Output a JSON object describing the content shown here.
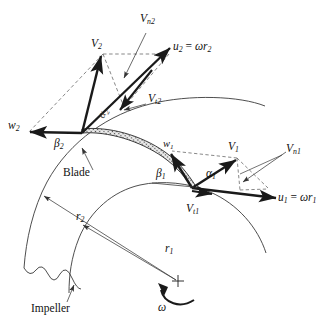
{
  "figure": {
    "title_caption": "",
    "type": "diagram",
    "colors": {
      "line": "#1a1a1a",
      "thin_line": "#3a3a3a",
      "background": "#ffffff",
      "blade_fill": "#d8d8d8"
    }
  },
  "labels": {
    "V2": {
      "base": "V",
      "sub": "2"
    },
    "Vn2": {
      "base": "V",
      "sub": "n2"
    },
    "Vt2": {
      "base": "V",
      "sub": "t2"
    },
    "u2": {
      "text": "u",
      "sub": "2",
      "eq": " = ",
      "omega": "ω",
      "r": "r",
      "rsub": "2"
    },
    "w2": {
      "base": "w",
      "sub": "2"
    },
    "beta2": {
      "base": "β",
      "sub": "2"
    },
    "alpha2": {
      "base": "α",
      "sub": "2"
    },
    "V1": {
      "base": "V",
      "sub": "1"
    },
    "Vn1": {
      "base": "V",
      "sub": "n1"
    },
    "Vt1": {
      "base": "V",
      "sub": "t1"
    },
    "u1": {
      "text": "u",
      "sub": "1",
      "eq": " = ",
      "omega": "ω",
      "r": "r",
      "rsub": "1"
    },
    "w1": {
      "base": "w",
      "sub": "1"
    },
    "beta1": {
      "base": "β",
      "sub": "1"
    },
    "alpha1": {
      "base": "α",
      "sub": "1"
    },
    "r1": {
      "base": "r",
      "sub": "1"
    },
    "r2": {
      "base": "r",
      "sub": "2"
    },
    "blade": "Blade",
    "impeller": "Impeller",
    "omega": "ω"
  },
  "geometry": {
    "center": {
      "x": 178,
      "y": 282
    },
    "exit_point": {
      "x": 82,
      "y": 133
    },
    "inlet_point": {
      "x": 192,
      "y": 188
    },
    "r1_value": 110,
    "r2_value": 196
  },
  "vectors": [
    {
      "name": "u2",
      "label": "u2 = ωr2",
      "from": "exit_point",
      "direction": "up-right",
      "style": "bold"
    },
    {
      "name": "V2",
      "label": "V2",
      "from": "exit_point",
      "direction": "up",
      "style": "bold"
    },
    {
      "name": "w2",
      "label": "w2",
      "from": "exit_point",
      "direction": "left",
      "style": "bold"
    },
    {
      "name": "Vt2",
      "label": "Vt2",
      "from": "u2-tip-region",
      "direction": "down-left",
      "style": "bold"
    },
    {
      "name": "Vn2",
      "label": "Vn2",
      "from": "leader",
      "direction": "down-right",
      "style": "thin"
    },
    {
      "name": "u1",
      "label": "u1 = ωr1",
      "from": "inlet_point",
      "direction": "right-down",
      "style": "bold"
    },
    {
      "name": "V1",
      "label": "V1",
      "from": "inlet_point",
      "direction": "up-right",
      "style": "bold"
    },
    {
      "name": "w1",
      "label": "w1",
      "from": "inlet_point",
      "direction": "up-left",
      "style": "bold"
    },
    {
      "name": "Vt1",
      "label": "Vt1",
      "from": "inlet_point",
      "direction": "right",
      "style": "bold"
    },
    {
      "name": "Vn1",
      "label": "Vn1",
      "from": "leader",
      "direction": "down-left",
      "style": "thin"
    }
  ],
  "annotations": [
    {
      "name": "blade-leader",
      "label": "Blade"
    },
    {
      "name": "impeller-leader",
      "label": "Impeller"
    },
    {
      "name": "r1-dimension",
      "label": "r1"
    },
    {
      "name": "r2-dimension",
      "label": "r2"
    },
    {
      "name": "rotation-arrow",
      "label": "ω"
    }
  ]
}
